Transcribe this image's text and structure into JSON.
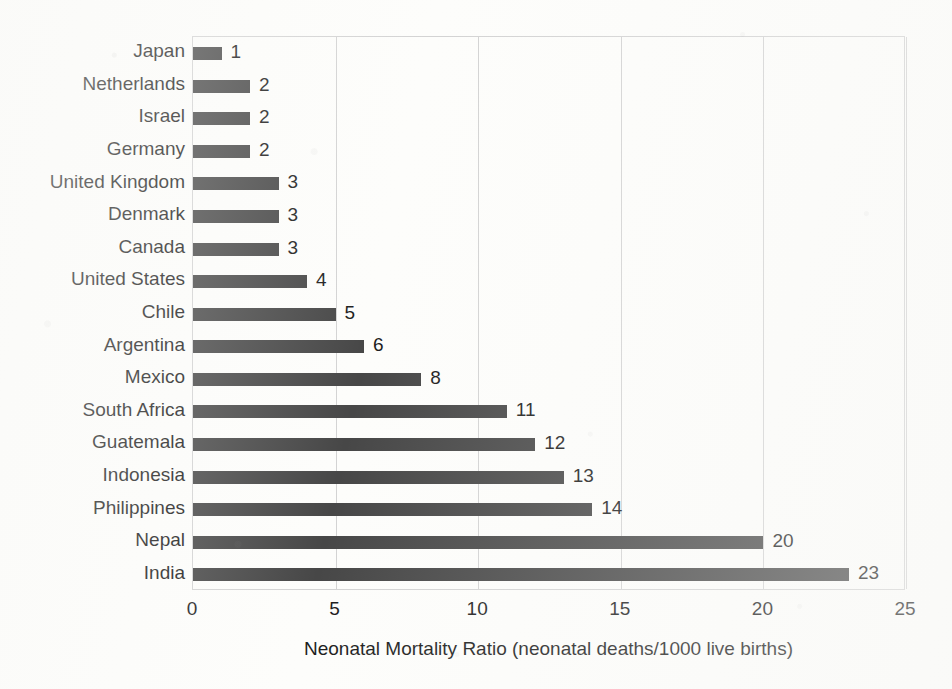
{
  "chart_data": {
    "type": "bar",
    "orientation": "horizontal",
    "title": "",
    "xlabel": "Neonatal Mortality Ratio (neonatal deaths/1000 live births)",
    "ylabel": "",
    "xlim": [
      0,
      25
    ],
    "xticks": [
      0,
      5,
      10,
      15,
      20,
      25
    ],
    "xtick_labels": [
      "0",
      "5",
      "10",
      "15",
      "20",
      "25"
    ],
    "grid": "vertical",
    "legend": "none",
    "bar_color": "#474747",
    "gridline_color": "#d3d3d3",
    "text_color": "#1c1c1c",
    "background_color": "#fdfdfb",
    "data_labels": true,
    "categories": [
      "Japan",
      "Netherlands",
      "Israel",
      "Germany",
      "United Kingdom",
      "Denmark",
      "Canada",
      "United States",
      "Chile",
      "Argentina",
      "Mexico",
      "South Africa",
      "Guatemala",
      "Indonesia",
      "Philippines",
      "Nepal",
      "India"
    ],
    "values": [
      1,
      2,
      2,
      2,
      3,
      3,
      3,
      4,
      5,
      6,
      8,
      11,
      12,
      13,
      14,
      20,
      23
    ],
    "value_labels": [
      "1",
      "2",
      "2",
      "2",
      "3",
      "3",
      "3",
      "4",
      "5",
      "6",
      "8",
      "11",
      "12",
      "13",
      "14",
      "20",
      "23"
    ]
  }
}
